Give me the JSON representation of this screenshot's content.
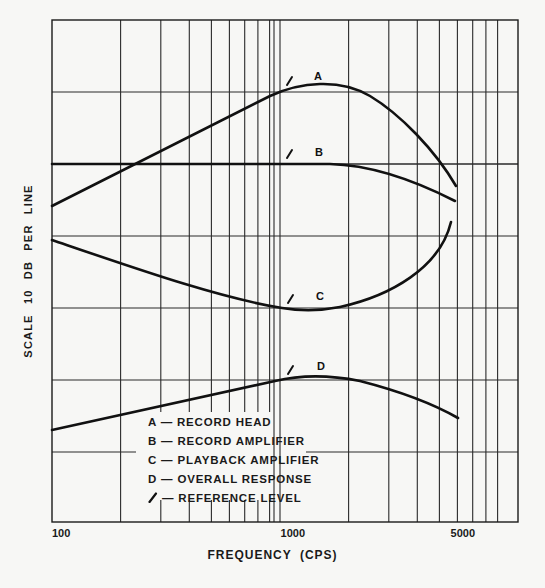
{
  "chart_data": {
    "type": "line",
    "title": "",
    "xlabel": "FREQUENCY (CPS)",
    "ylabel": "SCALE  10 DB  PER  LINE",
    "xscale": "log",
    "xlim": [
      100,
      10000
    ],
    "x_tick_labels": [
      {
        "value": 100,
        "label": "100"
      },
      {
        "value": 1000,
        "label": "1000"
      },
      {
        "value": 5000,
        "label": "5000"
      }
    ],
    "y_grid_spacing_db": 10,
    "grid": true,
    "legend_position": "lower-center-inside",
    "series": [
      {
        "name": "A",
        "label": "RECORD HEAD",
        "points": [
          [
            100,
            0
          ],
          [
            200,
            3
          ],
          [
            500,
            8.3
          ],
          [
            1000,
            15.8
          ],
          [
            1500,
            16.6
          ],
          [
            2000,
            15.5
          ],
          [
            3000,
            10.5
          ],
          [
            4000,
            5.5
          ],
          [
            4800,
            1
          ]
        ]
      },
      {
        "name": "B",
        "label": "RECORD AMPLIFIER",
        "points": [
          [
            100,
            0
          ],
          [
            500,
            0
          ],
          [
            1000,
            0
          ],
          [
            1500,
            0
          ],
          [
            2000,
            -0.3
          ],
          [
            3000,
            -2.5
          ],
          [
            4000,
            -4.8
          ],
          [
            4800,
            -5.2
          ]
        ]
      },
      {
        "name": "C",
        "label": "PLAYBACK AMPLIFIER",
        "points": [
          [
            100,
            0
          ],
          [
            200,
            -3.2
          ],
          [
            500,
            -7.5
          ],
          [
            1000,
            -9.7
          ],
          [
            1500,
            -9.8
          ],
          [
            2000,
            -9
          ],
          [
            3000,
            -6
          ],
          [
            4000,
            -1.5
          ],
          [
            4600,
            2.5
          ]
        ]
      },
      {
        "name": "D",
        "label": "OVERALL RESPONSE",
        "points": [
          [
            100,
            0
          ],
          [
            200,
            2
          ],
          [
            500,
            4.8
          ],
          [
            1000,
            7
          ],
          [
            1500,
            7.3
          ],
          [
            2000,
            7
          ],
          [
            3000,
            4.5
          ],
          [
            4000,
            0.8
          ],
          [
            4900,
            -2
          ]
        ]
      }
    ],
    "reference_level_frequency": 1000,
    "annotations": [
      "A",
      "B",
      "C",
      "D"
    ]
  },
  "axes": {
    "ylabel": "SCALE  10 DB  PER  LINE",
    "xlabel": "FREQUENCY (CPS)",
    "ticks": [
      "100",
      "1000",
      "5000"
    ]
  },
  "legend": {
    "items": [
      {
        "key": "A",
        "sep": "—",
        "text": "RECORD HEAD"
      },
      {
        "key": "B",
        "sep": "—",
        "text": "RECORD AMPLIFIER"
      },
      {
        "key": "C",
        "sep": "—",
        "text": "PLAYBACK AMPLIFIER"
      },
      {
        "key": "D",
        "sep": "—",
        "text": "OVERALL RESPONSE"
      },
      {
        "key": "↙",
        "sep": "—",
        "text": "REFERENCE LEVEL",
        "icon": "reference-arrow-icon"
      }
    ]
  },
  "curve_labels": {
    "a": "A",
    "b": "B",
    "c": "C",
    "d": "D"
  },
  "colors": {
    "ink": "#1a1a1a",
    "paper": "#f7f7f5",
    "grid": "#2a2a2a"
  }
}
